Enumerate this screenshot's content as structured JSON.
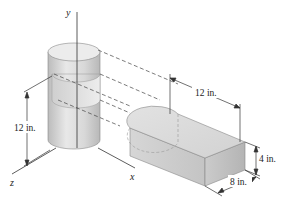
{
  "figure": {
    "axes": {
      "x_label": "x",
      "y_label": "y",
      "z_label": "z"
    },
    "dimensions": {
      "cylinder_height": "12 in.",
      "box_length": "12 in.",
      "box_height": "4 in.",
      "box_width": "8 in."
    },
    "colors": {
      "line": "#333333",
      "solid_light": "#e6e6e6",
      "solid_mid": "#d4d4d4",
      "solid_dark": "#bdbdbd",
      "background": "#ffffff"
    }
  }
}
